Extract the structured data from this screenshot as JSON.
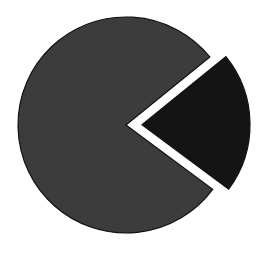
{
  "chart_data": {
    "type": "pie",
    "title": "",
    "categories": [
      "Slice A",
      "Slice B"
    ],
    "values": [
      79,
      21
    ],
    "colors": [
      "#3c3c3c",
      "#141414"
    ],
    "exploded": [
      false,
      true
    ],
    "start_angle_deg": 39,
    "legend": "none",
    "labels_visible": false
  },
  "render": {
    "center_x": 126,
    "center_y": 125,
    "radius": 108,
    "explode_offset": 16,
    "stroke": "#111111",
    "background": "#ffffff"
  }
}
